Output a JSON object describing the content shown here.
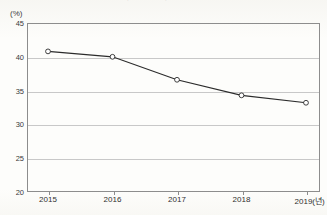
{
  "title_fragment": "ᅳ  ᅳ  ᄀ  ᄀ  ᅡ  ᄀ  ᅡ",
  "axis": {
    "unit_label": "(%)",
    "x_unit_suffix": "(년)"
  },
  "chart_data": {
    "type": "line",
    "title": "",
    "xlabel": "",
    "ylabel": "(%)",
    "categories": [
      "2015",
      "2016",
      "2017",
      "2018",
      "2019"
    ],
    "x_tick_labels": [
      "2015",
      "2016",
      "2017",
      "2018",
      "2019(년)"
    ],
    "values": [
      40.8,
      40.0,
      36.6,
      34.3,
      33.2
    ],
    "ylim": [
      20,
      45
    ],
    "y_ticks": [
      45,
      40,
      35,
      30,
      25,
      20
    ],
    "y_tick_labels": [
      "45",
      "40",
      "35",
      "30",
      "25",
      "20"
    ],
    "grid": true,
    "grid_orientation": "horizontal",
    "legend": false,
    "marker": "open-circle",
    "line_color": "#2b2b2b",
    "marker_face_color": "#ffffff",
    "grid_color": "#c8c8c8",
    "frame_color": "#8d8d8d"
  }
}
